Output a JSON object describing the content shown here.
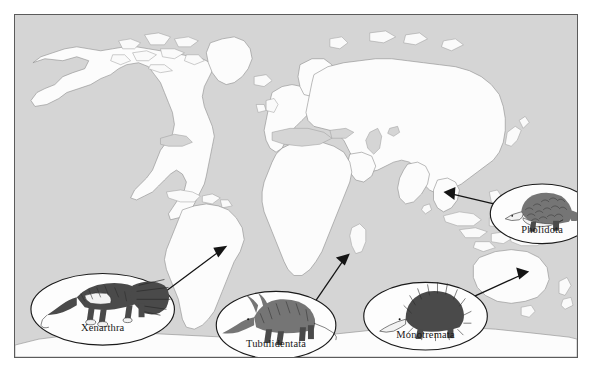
{
  "figure": {
    "type": "world-distribution-map",
    "projection_note": "world map, equirectangular-like",
    "ocean_color": "#d5d5d5",
    "land_color": "#fcfcfc",
    "land_outline_color": "#8d8d8d",
    "border_color": "#5b5b5b",
    "page_background": "#ffffff"
  },
  "callouts": [
    {
      "id": "xenarthra",
      "label": "Xenarthra",
      "animal_icon": "anteater-illustration",
      "arrow_target_region": "South America",
      "ellipse": {
        "cx": 88,
        "cy": 296,
        "rx": 72,
        "ry": 36
      },
      "label_y": 318,
      "arrow": {
        "x1": 146,
        "y1": 282,
        "x2": 213,
        "y2": 232
      }
    },
    {
      "id": "tubulidentata",
      "label": "Tubulidentata",
      "animal_icon": "aardvark-illustration",
      "arrow_target_region": "Africa",
      "ellipse": {
        "cx": 262,
        "cy": 312,
        "rx": 60,
        "ry": 34
      },
      "label_y": 334,
      "arrow": {
        "x1": 300,
        "y1": 290,
        "x2": 336,
        "y2": 240
      }
    },
    {
      "id": "monotremata",
      "label": "Monotremata",
      "animal_icon": "echidna-illustration",
      "arrow_target_region": "Australia",
      "ellipse": {
        "cx": 412,
        "cy": 303,
        "rx": 62,
        "ry": 34
      },
      "label_y": 325,
      "arrow": {
        "x1": 452,
        "y1": 287,
        "x2": 516,
        "y2": 258
      }
    },
    {
      "id": "pholidota",
      "label": "Pholidota",
      "animal_icon": "pangolin-illustration",
      "arrow_target_region": "Southeast Asia",
      "ellipse": {
        "cx": 529,
        "cy": 200,
        "rx": 52,
        "ry": 30
      },
      "label_y": 219,
      "arrow": {
        "x1": 489,
        "y1": 192,
        "x2": 430,
        "y2": 178
      }
    }
  ]
}
